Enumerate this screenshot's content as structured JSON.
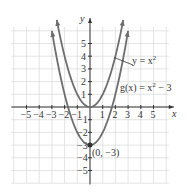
{
  "chart_data": {
    "type": "line",
    "title": "",
    "xlabel": "x",
    "ylabel": "y",
    "xlim": [
      -5.5,
      6
    ],
    "ylim": [
      -6,
      6.5
    ],
    "grid": true,
    "x_ticks": [
      "-5",
      "-4",
      "-3",
      "-2",
      "-1",
      "1",
      "2",
      "3",
      "4",
      "5"
    ],
    "y_ticks": [
      "5",
      "4",
      "3",
      "2",
      "1",
      "-1",
      "-2",
      "-3",
      "-4",
      "-5"
    ],
    "series": [
      {
        "name": "y = x^2",
        "formula": "x^2",
        "x": [
          -2.4,
          -2,
          -1,
          0,
          1,
          2,
          2.4
        ],
        "y": [
          5.76,
          4,
          1,
          0,
          1,
          4,
          5.76
        ]
      },
      {
        "name": "g(x) = x^2 - 3",
        "formula": "x^2-3",
        "x": [
          -3,
          -2,
          -1,
          0,
          1,
          2,
          3
        ],
        "y": [
          6,
          1,
          -2,
          -3,
          -2,
          1,
          6
        ]
      }
    ],
    "annotations": [
      {
        "text": "y = x²",
        "points_to": "y = x^2"
      },
      {
        "text": "g(x) = x² − 3",
        "points_to": "g(x) = x^2 - 3"
      },
      {
        "text": "(0, −3)",
        "x": 0,
        "y": -3
      }
    ],
    "colors": {
      "curve": "#6e6e6e",
      "axis": "#333333",
      "grid": "#d9d9d9"
    }
  },
  "labels": {
    "x_axis": "x",
    "y_axis": "y",
    "curve1": "y = x",
    "curve1_exp": "2",
    "curve2_a": "g(x) = x",
    "curve2_exp": "2",
    "curve2_b": " − 3",
    "vertex": "(0, −3)"
  }
}
